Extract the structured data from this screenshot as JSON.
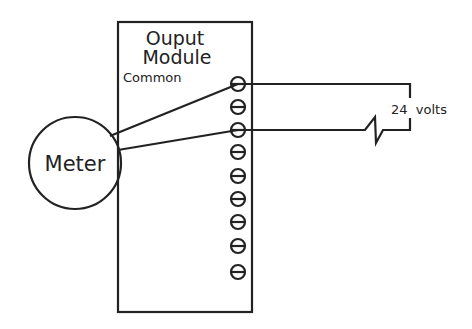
{
  "module": {
    "title_line1": "Ouput",
    "title_line2": "Module",
    "common_label": "Common",
    "terminal_count": 9
  },
  "meter": {
    "label": "Meter"
  },
  "supply": {
    "label": "24  volts"
  },
  "colors": {
    "stroke": "#222222",
    "background": "#ffffff"
  }
}
